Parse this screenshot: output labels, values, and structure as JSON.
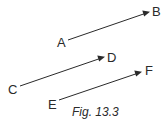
{
  "figure": {
    "caption": "Fig. 13.3",
    "color": "#2a2a2a",
    "vectors": [
      {
        "id": "AB",
        "from": "A",
        "to": "B"
      },
      {
        "id": "CD",
        "from": "C",
        "to": "D"
      },
      {
        "id": "EF",
        "from": "E",
        "to": "F"
      }
    ],
    "labels": {
      "A": "A",
      "B": "B",
      "C": "C",
      "D": "D",
      "E": "E",
      "F": "F"
    }
  }
}
